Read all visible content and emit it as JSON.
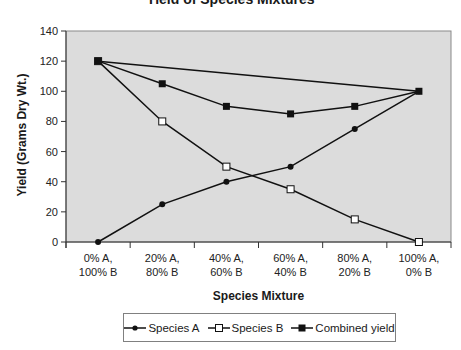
{
  "chart_data": {
    "type": "line",
    "xlabel": "Species Mixture",
    "ylabel": "Yield (Grams Dry Wt.)",
    "ylim": [
      0,
      140
    ],
    "yticks": [
      0,
      20,
      40,
      60,
      80,
      100,
      120,
      140
    ],
    "categories": [
      "0% A, 100% B",
      "20% A, 80% B",
      "40% A, 60% B",
      "60% A, 40% B",
      "80% A, 20% B",
      "100% A, 0% B"
    ],
    "category_lines": [
      [
        "0% A,",
        "100% B"
      ],
      [
        "20% A,",
        "80% B"
      ],
      [
        "40% A,",
        "60% B"
      ],
      [
        "60% A,",
        "40% B"
      ],
      [
        "80% A,",
        "20% B"
      ],
      [
        "100% A,",
        "0% B"
      ]
    ],
    "series": [
      {
        "name": "Species A",
        "marker": "circle",
        "values": [
          0,
          25,
          40,
          50,
          75,
          100
        ]
      },
      {
        "name": "Species B",
        "marker": "open-square",
        "values": [
          120,
          80,
          50,
          35,
          15,
          0
        ]
      },
      {
        "name": "Combined yield",
        "marker": "filled-square",
        "values": [
          120,
          105,
          90,
          85,
          90,
          100
        ]
      }
    ],
    "reference_line": {
      "from": [
        0,
        120
      ],
      "to": [
        5,
        100
      ],
      "description": "straight line joining pure-stand yields"
    },
    "grid": false,
    "legend_position": "bottom",
    "plot_background": "#dcdcdc"
  },
  "legend": {
    "items": [
      {
        "label": "Species A",
        "marker": "circle-icon"
      },
      {
        "label": "Species B",
        "marker": "open-square-icon"
      },
      {
        "label": "Combined yield",
        "marker": "filled-square-icon"
      }
    ]
  },
  "labels": {
    "title": "Yield of Species Mixtures",
    "xlabel": "Species Mixture",
    "ylabel": "Yield (Grams Dry Wt.)"
  }
}
